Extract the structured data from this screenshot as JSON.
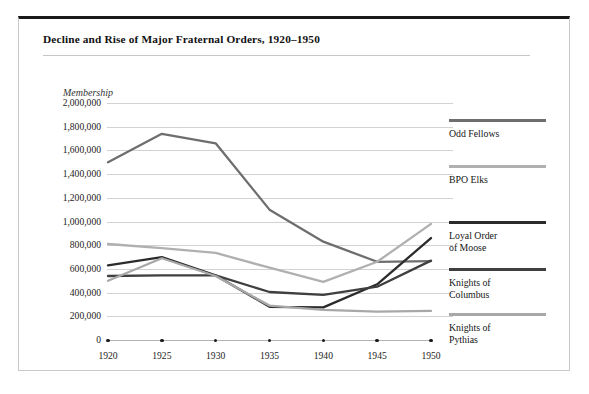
{
  "figure": {
    "title": "Decline and Rise of Major Fraternal Orders, 1920–1950"
  },
  "chart_data": {
    "type": "line",
    "title": "Decline and Rise of Major Fraternal Orders, 1920–1950",
    "xlabel": "",
    "ylabel": "Membership",
    "x": [
      1920,
      1925,
      1930,
      1935,
      1940,
      1945,
      1950
    ],
    "xlim": [
      1920,
      1950
    ],
    "ylim": [
      0,
      2000000
    ],
    "yticks": [
      0,
      200000,
      400000,
      600000,
      800000,
      1000000,
      1200000,
      1400000,
      1600000,
      1800000,
      2000000
    ],
    "ytick_labels": [
      "0",
      "200,000",
      "400,000",
      "600,000",
      "800,000",
      "1,000,000",
      "1,200,000",
      "1,400,000",
      "1,600,000",
      "1,800,000",
      "2,000,000"
    ],
    "xtick_labels": [
      "1920",
      "1925",
      "1930",
      "1935",
      "1940",
      "1945",
      "1950"
    ],
    "grid": true,
    "legend_position": "right",
    "series": [
      {
        "name": "Odd Fellows",
        "color": "#6e6e6e",
        "values": [
          1500000,
          1740000,
          1660000,
          1100000,
          830000,
          660000,
          665000
        ]
      },
      {
        "name": "BPO Elks",
        "color": "#b0b0b0",
        "values": [
          810000,
          775000,
          735000,
          610000,
          490000,
          660000,
          980000
        ]
      },
      {
        "name": "Loyal Order of Moose",
        "color": "#2b2b2b",
        "values": [
          630000,
          700000,
          545000,
          280000,
          275000,
          470000,
          860000
        ]
      },
      {
        "name": "Knights of Columbus",
        "color": "#3f3f3f",
        "values": [
          540000,
          545000,
          545000,
          405000,
          380000,
          450000,
          670000
        ]
      },
      {
        "name": "Knights of Pythias",
        "color": "#a8a8a8",
        "values": [
          500000,
          690000,
          540000,
          290000,
          255000,
          240000,
          245000
        ]
      }
    ]
  },
  "legend": {
    "entries": [
      {
        "label": "Odd Fellows",
        "color": "#6e6e6e"
      },
      {
        "label": "BPO Elks",
        "color": "#b0b0b0"
      },
      {
        "label": "Loyal Order\nof Moose",
        "color": "#2b2b2b"
      },
      {
        "label": "Knights of\nColumbus",
        "color": "#3f3f3f"
      },
      {
        "label": "Knights of\nPythias",
        "color": "#a8a8a8"
      }
    ]
  }
}
